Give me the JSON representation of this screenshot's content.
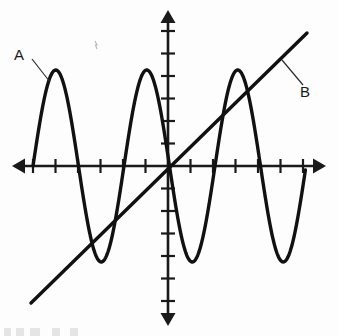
{
  "figure": {
    "title": "",
    "background_color": "#fdfdfd",
    "stroke_color": "#111111",
    "axis_color": "#1a1a1a",
    "width": 338,
    "height": 336
  },
  "labels": {
    "curve_a": "A",
    "curve_b": "B"
  },
  "annotations": [
    {
      "text": "A",
      "target": "sine-curve-first-peak",
      "label_x": 20,
      "label_y": 54,
      "leader_from_x": 32,
      "leader_from_y": 59,
      "leader_to_x": 50,
      "leader_to_y": 82
    },
    {
      "text": "B",
      "target": "diagonal-line",
      "label_x": 305,
      "label_y": 91,
      "leader_from_x": 303,
      "leader_from_y": 85,
      "leader_to_x": 282,
      "leader_to_y": 60
    }
  ],
  "axes": {
    "origin_x": 168,
    "origin_y": 166,
    "x_axis": {
      "start_x": 12,
      "end_x": 326,
      "y": 166,
      "arrow_both_ends": true
    },
    "y_axis": {
      "start_y": 10,
      "end_y": 326,
      "x": 168,
      "arrow_both_ends": true
    },
    "x_tick_spacing": 22.5,
    "y_tick_spacing": 22.5,
    "x_tick_half_length": 7,
    "y_tick_half_length": 7,
    "x_ticks_positive": 6,
    "x_ticks_negative": 6,
    "y_ticks_positive": 6,
    "y_ticks_negative": 6,
    "x_tick_labels": [],
    "y_tick_labels": [],
    "grid": false
  },
  "chart_data": {
    "type": "line",
    "title": "",
    "xlabel": "",
    "ylabel": "",
    "grid": false,
    "legend": "inline-annotations",
    "xlim": [
      -7,
      7
    ],
    "ylim": [
      -7,
      7
    ],
    "series": [
      {
        "name": "A",
        "description": "sinusoidal curve, three positive peaks and three negative troughs",
        "type": "sine",
        "amplitude_px": 96,
        "period_px": 91,
        "phase_start_x_px": 33,
        "draw_x_start_px": 33,
        "draw_x_end_px": 306,
        "peaks": [
          {
            "x_px": 55,
            "y_px": 70
          },
          {
            "x_px": 146,
            "y_px": 70
          },
          {
            "x_px": 237,
            "y_px": 70
          }
        ],
        "troughs": [
          {
            "x_px": 101,
            "y_px": 263
          },
          {
            "x_px": 192,
            "y_px": 263
          },
          {
            "x_px": 283,
            "y_px": 263
          }
        ],
        "zero_crossings_px": [
          33,
          78,
          124,
          169,
          214,
          260,
          306
        ]
      },
      {
        "name": "B",
        "description": "straight line with positive slope through the origin",
        "type": "line",
        "point_start": {
          "x_px": 31,
          "y_px": 303
        },
        "point_end": {
          "x_px": 307,
          "y_px": 33
        },
        "passes_through_origin": true,
        "slope_px": -0.978
      }
    ]
  }
}
